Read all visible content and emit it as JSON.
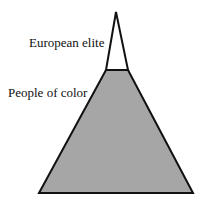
{
  "diagram": {
    "type": "pyramid",
    "layers": [
      {
        "label": "European elite",
        "fill": "#ffffff",
        "position": "top"
      },
      {
        "label": "People of color",
        "fill": "#a6a6a6",
        "position": "bottom"
      }
    ],
    "stroke": "#111111"
  }
}
